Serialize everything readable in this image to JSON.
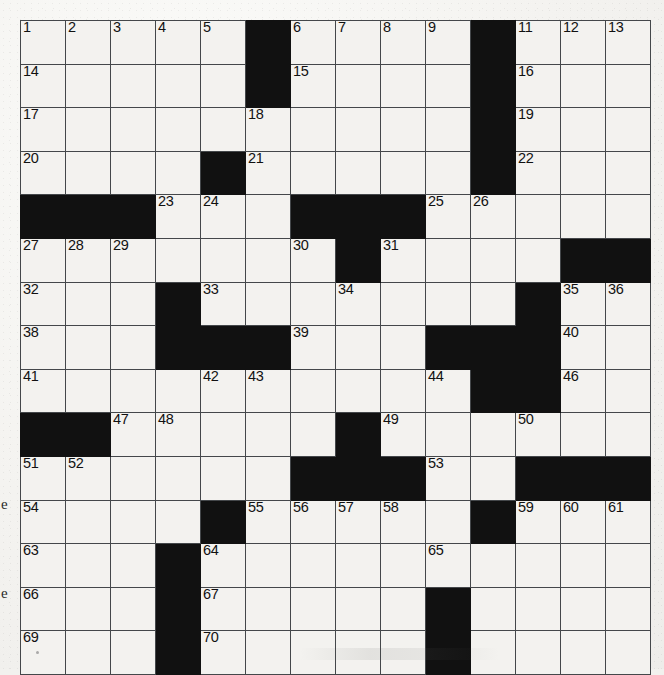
{
  "puzzle": {
    "type": "crossword-grid",
    "title_visible": false,
    "rows": 15,
    "cols": 14,
    "cell_size_px": 45,
    "colors": {
      "paper": "#f3f2ef",
      "block": "#111111",
      "rule": "#44474a",
      "number": "#111111"
    },
    "layout_legend": {
      "0": "white (fillable) cell",
      "1": "black (blocked) cell"
    },
    "blocks": [
      [
        0,
        0,
        0,
        0,
        0,
        1,
        0,
        0,
        0,
        0,
        1,
        0,
        0,
        0
      ],
      [
        0,
        0,
        0,
        0,
        0,
        1,
        0,
        0,
        0,
        0,
        1,
        0,
        0,
        0
      ],
      [
        0,
        0,
        0,
        0,
        0,
        0,
        0,
        0,
        0,
        0,
        1,
        0,
        0,
        0
      ],
      [
        0,
        0,
        0,
        0,
        1,
        0,
        0,
        0,
        0,
        0,
        1,
        0,
        0,
        0
      ],
      [
        1,
        1,
        1,
        0,
        0,
        0,
        1,
        1,
        1,
        0,
        0,
        0,
        0,
        0
      ],
      [
        0,
        0,
        0,
        0,
        0,
        0,
        0,
        1,
        0,
        0,
        0,
        0,
        1,
        1
      ],
      [
        0,
        0,
        0,
        1,
        0,
        0,
        0,
        0,
        0,
        0,
        0,
        1,
        0,
        0
      ],
      [
        0,
        0,
        0,
        1,
        1,
        1,
        0,
        0,
        0,
        1,
        1,
        1,
        0,
        0
      ],
      [
        0,
        0,
        0,
        0,
        0,
        0,
        0,
        0,
        0,
        0,
        1,
        1,
        0,
        0
      ],
      [
        1,
        1,
        0,
        0,
        0,
        0,
        0,
        1,
        0,
        0,
        0,
        0,
        0,
        0
      ],
      [
        0,
        0,
        0,
        0,
        0,
        0,
        1,
        1,
        1,
        0,
        0,
        1,
        1,
        1
      ],
      [
        0,
        0,
        0,
        0,
        1,
        0,
        0,
        0,
        0,
        0,
        1,
        0,
        0,
        0
      ],
      [
        0,
        0,
        0,
        1,
        0,
        0,
        0,
        0,
        0,
        0,
        0,
        0,
        0,
        0
      ],
      [
        0,
        0,
        0,
        1,
        0,
        0,
        0,
        0,
        0,
        1,
        0,
        0,
        0,
        0
      ],
      [
        0,
        0,
        0,
        1,
        0,
        0,
        0,
        0,
        0,
        1,
        0,
        0,
        0,
        0
      ]
    ],
    "numbers": [
      {
        "row": 0,
        "col": 0,
        "n": "1"
      },
      {
        "row": 0,
        "col": 1,
        "n": "2"
      },
      {
        "row": 0,
        "col": 2,
        "n": "3"
      },
      {
        "row": 0,
        "col": 3,
        "n": "4"
      },
      {
        "row": 0,
        "col": 4,
        "n": "5"
      },
      {
        "row": 0,
        "col": 6,
        "n": "6"
      },
      {
        "row": 0,
        "col": 7,
        "n": "7"
      },
      {
        "row": 0,
        "col": 8,
        "n": "8"
      },
      {
        "row": 0,
        "col": 9,
        "n": "9"
      },
      {
        "row": 0,
        "col": 10,
        "n": "10"
      },
      {
        "row": 0,
        "col": 11,
        "n": "11"
      },
      {
        "row": 0,
        "col": 12,
        "n": "12"
      },
      {
        "row": 0,
        "col": 13,
        "n": "13"
      },
      {
        "row": 1,
        "col": 0,
        "n": "14"
      },
      {
        "row": 1,
        "col": 6,
        "n": "15"
      },
      {
        "row": 1,
        "col": 11,
        "n": "16"
      },
      {
        "row": 2,
        "col": 0,
        "n": "17"
      },
      {
        "row": 2,
        "col": 5,
        "n": "18"
      },
      {
        "row": 2,
        "col": 11,
        "n": "19"
      },
      {
        "row": 3,
        "col": 0,
        "n": "20"
      },
      {
        "row": 3,
        "col": 5,
        "n": "21"
      },
      {
        "row": 3,
        "col": 11,
        "n": "22"
      },
      {
        "row": 4,
        "col": 3,
        "n": "23"
      },
      {
        "row": 4,
        "col": 4,
        "n": "24"
      },
      {
        "row": 4,
        "col": 9,
        "n": "25"
      },
      {
        "row": 4,
        "col": 10,
        "n": "26"
      },
      {
        "row": 5,
        "col": 0,
        "n": "27"
      },
      {
        "row": 5,
        "col": 1,
        "n": "28"
      },
      {
        "row": 5,
        "col": 2,
        "n": "29"
      },
      {
        "row": 5,
        "col": 6,
        "n": "30"
      },
      {
        "row": 5,
        "col": 8,
        "n": "31"
      },
      {
        "row": 6,
        "col": 0,
        "n": "32"
      },
      {
        "row": 6,
        "col": 4,
        "n": "33"
      },
      {
        "row": 6,
        "col": 7,
        "n": "34"
      },
      {
        "row": 6,
        "col": 12,
        "n": "35"
      },
      {
        "row": 6,
        "col": 13,
        "n": "36"
      },
      {
        "row": 6,
        "col": 14,
        "n": "37"
      },
      {
        "row": 7,
        "col": 0,
        "n": "38"
      },
      {
        "row": 7,
        "col": 6,
        "n": "39"
      },
      {
        "row": 7,
        "col": 12,
        "n": "40"
      },
      {
        "row": 8,
        "col": 0,
        "n": "41"
      },
      {
        "row": 8,
        "col": 4,
        "n": "42"
      },
      {
        "row": 8,
        "col": 5,
        "n": "43"
      },
      {
        "row": 8,
        "col": 9,
        "n": "44"
      },
      {
        "row": 8,
        "col": 10,
        "n": "45"
      },
      {
        "row": 8,
        "col": 12,
        "n": "46"
      },
      {
        "row": 9,
        "col": 2,
        "n": "47"
      },
      {
        "row": 9,
        "col": 3,
        "n": "48"
      },
      {
        "row": 9,
        "col": 8,
        "n": "49"
      },
      {
        "row": 9,
        "col": 11,
        "n": "50"
      },
      {
        "row": 10,
        "col": 0,
        "n": "51"
      },
      {
        "row": 10,
        "col": 1,
        "n": "52"
      },
      {
        "row": 10,
        "col": 9,
        "n": "53"
      },
      {
        "row": 11,
        "col": 0,
        "n": "54"
      },
      {
        "row": 11,
        "col": 5,
        "n": "55"
      },
      {
        "row": 11,
        "col": 6,
        "n": "56"
      },
      {
        "row": 11,
        "col": 7,
        "n": "57"
      },
      {
        "row": 11,
        "col": 8,
        "n": "58"
      },
      {
        "row": 11,
        "col": 11,
        "n": "59"
      },
      {
        "row": 11,
        "col": 12,
        "n": "60"
      },
      {
        "row": 11,
        "col": 13,
        "n": "61"
      },
      {
        "row": 11,
        "col": 14,
        "n": "62"
      },
      {
        "row": 12,
        "col": 0,
        "n": "63"
      },
      {
        "row": 12,
        "col": 4,
        "n": "64"
      },
      {
        "row": 12,
        "col": 9,
        "n": "65"
      },
      {
        "row": 13,
        "col": 0,
        "n": "66"
      },
      {
        "row": 13,
        "col": 4,
        "n": "67"
      },
      {
        "row": 13,
        "col": 9,
        "n": "68"
      },
      {
        "row": 14,
        "col": 0,
        "n": "69"
      },
      {
        "row": 14,
        "col": 4,
        "n": "70"
      },
      {
        "row": 14,
        "col": 9,
        "n": "71"
      }
    ],
    "margin_marks": [
      "e",
      "e"
    ]
  }
}
